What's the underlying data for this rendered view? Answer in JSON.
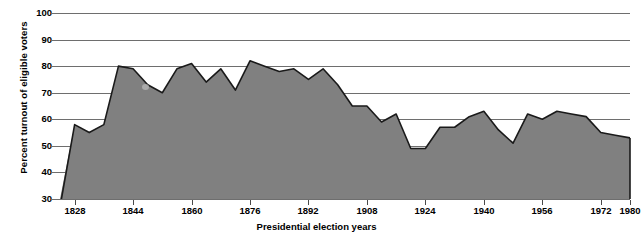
{
  "chart_data": {
    "type": "area",
    "title": "",
    "xlabel": "Presidential election years",
    "ylabel": "Percent turnout of eligible voters",
    "ylim": [
      30,
      100
    ],
    "xlim": [
      1824,
      1980
    ],
    "grid": true,
    "legend": null,
    "y_ticks": [
      100,
      90,
      80,
      70,
      60,
      50,
      40,
      30
    ],
    "x_ticks": [
      1828,
      1844,
      1860,
      1876,
      1892,
      1908,
      1924,
      1940,
      1956,
      1972,
      1980
    ],
    "fill_color": "#808080",
    "line_color": "#1a1a1a",
    "grid_color": "#6e6e6e",
    "x": [
      1824,
      1828,
      1832,
      1836,
      1840,
      1844,
      1848,
      1852,
      1856,
      1860,
      1864,
      1868,
      1872,
      1876,
      1880,
      1884,
      1888,
      1892,
      1896,
      1900,
      1904,
      1908,
      1912,
      1916,
      1920,
      1924,
      1928,
      1932,
      1936,
      1940,
      1944,
      1948,
      1952,
      1956,
      1960,
      1964,
      1968,
      1972,
      1976,
      1980
    ],
    "values": [
      27,
      58,
      55,
      58,
      80,
      79,
      73,
      70,
      79,
      81,
      74,
      79,
      71,
      82,
      80,
      78,
      79,
      75,
      79,
      73,
      65,
      65,
      59,
      62,
      49,
      49,
      57,
      57,
      61,
      63,
      56,
      51,
      62,
      60,
      63,
      62,
      61,
      55,
      54,
      53
    ]
  },
  "annotations": {
    "blot_label": "paper-smudge"
  }
}
